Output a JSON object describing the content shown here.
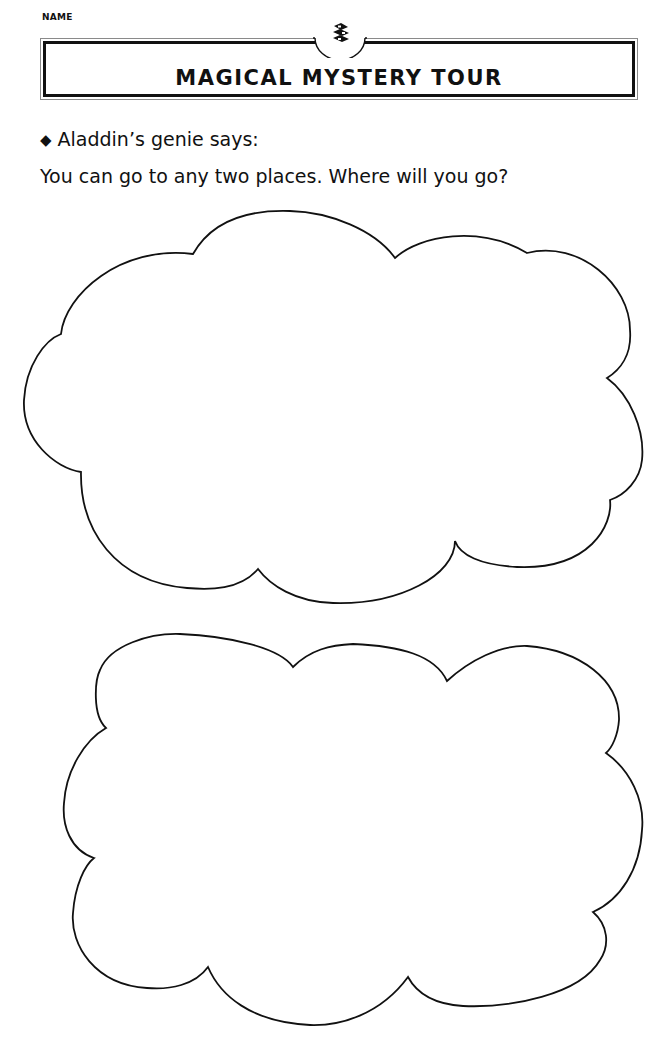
{
  "worksheet": {
    "name_label": "NAME",
    "title": "MAGICAL MYSTERY TOUR",
    "emblem_icon": "stacked-layers-icon",
    "prompt": {
      "bullet": "◆",
      "intro": "Aladdin’s genie says:",
      "question": "You can go to any two places. Where will you go?"
    },
    "answer_areas": [
      {
        "shape": "cloud",
        "label": "place-one"
      },
      {
        "shape": "cloud",
        "label": "place-two"
      }
    ],
    "colors": {
      "ink": "#111111",
      "paper": "#ffffff",
      "banner_outer_line": "#8a8a8a"
    }
  }
}
